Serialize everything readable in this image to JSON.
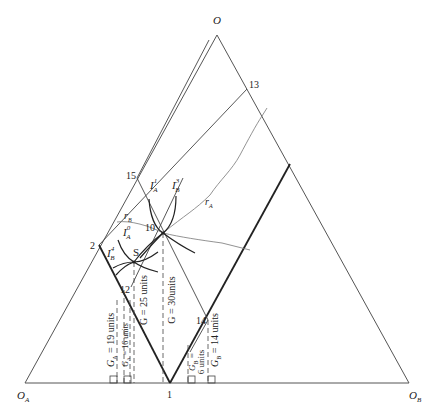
{
  "diagram": {
    "type": "edgeworth-box-triangle",
    "vertices": {
      "top": {
        "label": "O",
        "sub": ""
      },
      "left": {
        "label": "O",
        "sub": "A"
      },
      "right": {
        "label": "O",
        "sub": "B"
      }
    },
    "points": {
      "p1": "1",
      "p2": "2",
      "p10": "10",
      "p12": "12",
      "p13": "13",
      "p14": "14",
      "p15": "15",
      "S": "S"
    },
    "curves": {
      "IA1": {
        "base": "I",
        "sub": "A",
        "sup": "1"
      },
      "IB3": {
        "base": "I",
        "sub": "B",
        "sup": "3"
      },
      "IA0": {
        "base": "I",
        "sub": "A",
        "sup": "0"
      },
      "IB4": {
        "base": "I",
        "sub": "B",
        "sup": "4"
      },
      "rA": {
        "base": "r",
        "sub": "A"
      },
      "rB": {
        "base": "r",
        "sub": "B"
      }
    },
    "annotations": {
      "G30": "G = 30units",
      "G25": "G = 25 units",
      "GA19": {
        "pre": "G",
        "sub": "A",
        "post": " = 19 units"
      },
      "GA16": {
        "pre": "G",
        "sub": "A",
        "post": " = 16 units"
      },
      "GB6a": {
        "pre": "G",
        "sub": "B",
        "post": " ="
      },
      "GB6b": "6 units",
      "GB14": {
        "pre": "G",
        "sub": "B",
        "post": " = 14 units"
      }
    }
  }
}
